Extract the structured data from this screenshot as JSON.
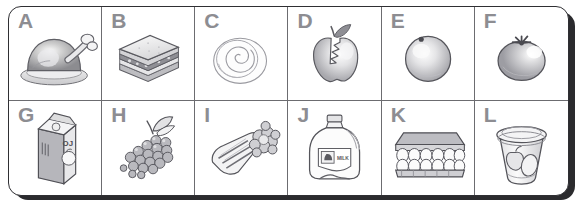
{
  "worksheet": {
    "title": "Food picture grid A to L",
    "frame": {
      "border_color": "#2f2f33",
      "shadow_color": "#2b2b2e",
      "background": "#ffffff",
      "grid_line_color": "#6c6c70"
    },
    "label_color": "#8d8d92",
    "columns": 6,
    "rows": 2,
    "cells": [
      {
        "label": "A",
        "icon": "roast-turkey-on-platter-icon",
        "item": "roast turkey on a platter"
      },
      {
        "label": "B",
        "icon": "sandwich-icon",
        "item": "sandwich"
      },
      {
        "label": "C",
        "icon": "swirl-pastry-bun-icon",
        "item": "swirled pastry bun"
      },
      {
        "label": "D",
        "icon": "bitten-apple-icon",
        "item": "apple with a bite taken out"
      },
      {
        "label": "E",
        "icon": "orange-fruit-icon",
        "item": "orange"
      },
      {
        "label": "F",
        "icon": "tomato-icon",
        "item": "tomato"
      },
      {
        "label": "G",
        "icon": "juice-carton-icon",
        "item": "orange juice carton",
        "package_text": "OJ"
      },
      {
        "label": "H",
        "icon": "grapes-icon",
        "item": "bunch of grapes"
      },
      {
        "label": "I",
        "icon": "celery-icon",
        "item": "celery stalks"
      },
      {
        "label": "J",
        "icon": "milk-jug-icon",
        "item": "milk jug",
        "package_text": "MILK"
      },
      {
        "label": "K",
        "icon": "egg-carton-icon",
        "item": "carton of eggs"
      },
      {
        "label": "L",
        "icon": "yogurt-cup-icon",
        "item": "yogurt cup with fruit"
      }
    ]
  }
}
